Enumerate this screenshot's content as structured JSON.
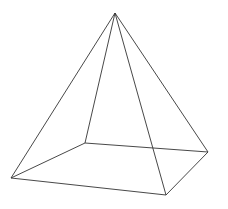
{
  "diagram": {
    "type": "square-pyramid-wireframe",
    "stroke_color": "#333333",
    "background": "#ffffff",
    "vertices": {
      "apex": [
        115,
        13
      ],
      "left": [
        11,
        178
      ],
      "back": [
        85,
        143
      ],
      "right": [
        208,
        152
      ],
      "front": [
        166,
        195
      ]
    },
    "edges": [
      [
        "apex",
        "left"
      ],
      [
        "apex",
        "back"
      ],
      [
        "apex",
        "right"
      ],
      [
        "apex",
        "front"
      ],
      [
        "left",
        "back"
      ],
      [
        "back",
        "right"
      ],
      [
        "right",
        "front"
      ],
      [
        "front",
        "left"
      ]
    ]
  }
}
